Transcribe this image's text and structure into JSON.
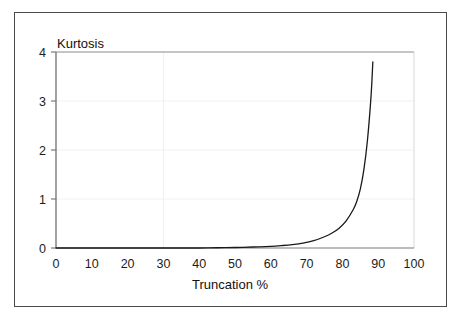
{
  "figure": {
    "background_color": "#ffffff",
    "frame_color": "#4a4a4a",
    "axis_color": "#6e6e6e",
    "grid_color": "#f0f0f0",
    "curve_color": "#1a1a1a"
  },
  "chart_data": {
    "type": "line",
    "title": "",
    "subtitle": "",
    "xlabel": "Truncation %",
    "ylabel": "Kurtosis",
    "xlim": [
      0,
      100
    ],
    "ylim": [
      0,
      4
    ],
    "xticks": [
      0,
      10,
      20,
      30,
      40,
      50,
      60,
      70,
      80,
      90,
      100
    ],
    "xtick_labels": [
      "0",
      "10",
      "20",
      "30",
      "40",
      "50",
      "60",
      "70",
      "80",
      "90",
      "100"
    ],
    "yticks": [
      0,
      1,
      2,
      3,
      4
    ],
    "ytick_labels": [
      "0",
      "1",
      "2",
      "3",
      "4"
    ],
    "grid": "faint horizontal gridlines at y=1,2,3 and a faint vertical gridline at x=30",
    "gridlines_x": [
      30
    ],
    "gridlines_y": [
      1,
      2,
      3
    ],
    "legend": "none",
    "legend_position": "none",
    "annotations": [],
    "series": [
      {
        "name": "Kurtosis vs Truncation %",
        "x": [
          0,
          5,
          10,
          15,
          20,
          25,
          30,
          35,
          40,
          45,
          50,
          55,
          60,
          63,
          66,
          69,
          72,
          75,
          77,
          79,
          81,
          83,
          84,
          85,
          86,
          87,
          88,
          88.5
        ],
        "values": [
          0.0,
          0.0,
          0.0,
          0.0,
          0.0,
          0.0,
          0.0,
          0.0,
          0.0,
          0.005,
          0.01,
          0.02,
          0.035,
          0.05,
          0.07,
          0.1,
          0.15,
          0.23,
          0.3,
          0.4,
          0.55,
          0.78,
          0.95,
          1.2,
          1.6,
          2.2,
          3.1,
          3.8
        ]
      }
    ]
  },
  "labels": {
    "y_axis_title": "Kurtosis",
    "x_axis_title": "Truncation %"
  }
}
